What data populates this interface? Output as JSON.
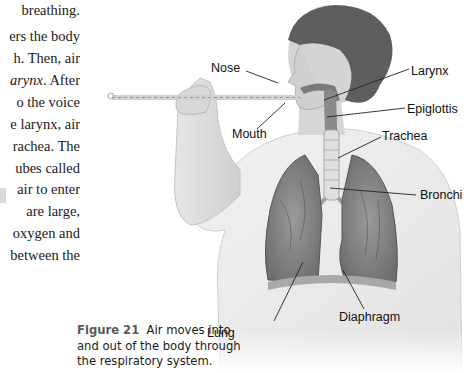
{
  "body_text": {
    "lines": [
      {
        "text": "breathing.",
        "top": 2
      },
      {
        "text": "ers the body",
        "top": 28
      },
      {
        "text": "h. Then, air",
        "top": 50
      },
      {
        "text_pre": "",
        "text_italic": "arynx",
        "text_post": ". After",
        "top": 72
      },
      {
        "text": "o the voice",
        "top": 94
      },
      {
        "text": "e larynx, air",
        "top": 116
      },
      {
        "text": "rachea. The",
        "top": 138
      },
      {
        "text": "ubes called",
        "top": 160
      },
      {
        "text": "air to enter",
        "top": 181
      },
      {
        "text": "are large,",
        "top": 203
      },
      {
        "text": "oxygen and",
        "top": 225
      },
      {
        "text": "between the",
        "top": 247
      }
    ]
  },
  "figure": {
    "labels": {
      "nose": "Nose",
      "mouth": "Mouth",
      "larynx": "Larynx",
      "epiglottis": "Epiglottis",
      "trachea": "Trachea",
      "bronchi": "Bronchi",
      "lung": "Lung",
      "diaphragm": "Diaphragm"
    },
    "caption": {
      "number": "Figure 21",
      "text": "Air moves into and out of the body through the respiratory system."
    }
  }
}
